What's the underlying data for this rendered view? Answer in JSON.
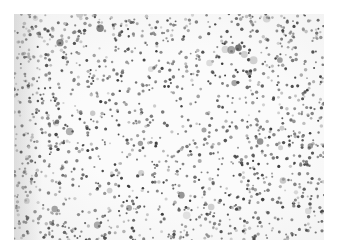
{
  "image": {
    "description": "Grayscale micrograph-style field of many small dark dots on a white background",
    "colors": {
      "background": "#fbfbfb",
      "dot_dark": "#3a3a3a",
      "dot_mid": "#7a7a7a",
      "dot_light": "#b5b5b5"
    },
    "dot_field": {
      "seed": 1337,
      "count": 1500,
      "large_count": 40,
      "edge_density_boost": 1.8
    }
  }
}
